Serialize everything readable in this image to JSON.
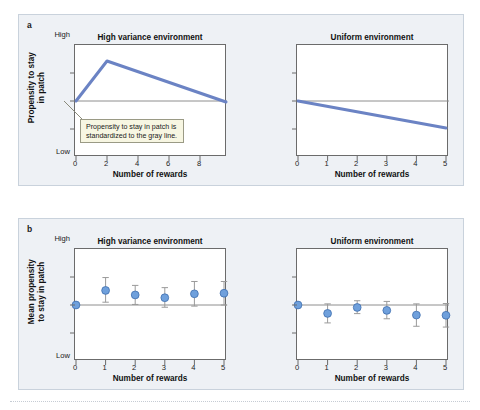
{
  "figure": {
    "panels": [
      {
        "letter": "a",
        "ylabel": "Propensity to stay\nin patch",
        "y_high_label": "High",
        "y_low_label": "Low",
        "plots": [
          {
            "title": "High variance environment",
            "xlabel": "Number of rewards",
            "xticks": [
              "0",
              "2",
              "4",
              "6",
              "8"
            ]
          },
          {
            "title": "Uniform environment",
            "xlabel": "Number of rewards",
            "xticks": [
              "0",
              "1",
              "2",
              "3",
              "4",
              "5"
            ]
          }
        ],
        "callout": "Propensity to stay in patch is\nstandardized to the gray line."
      },
      {
        "letter": "b",
        "ylabel": "Mean propensity\nto stay in patch",
        "y_high_label": "High",
        "y_low_label": "Low",
        "plots": [
          {
            "title": "High variance environment",
            "xlabel": "Number of rewards",
            "xticks": [
              "0",
              "1",
              "2",
              "3",
              "4",
              "5"
            ]
          },
          {
            "title": "Uniform environment",
            "xlabel": "Number of rewards",
            "xticks": [
              "0",
              "1",
              "2",
              "3",
              "4",
              "5"
            ]
          }
        ]
      }
    ]
  },
  "colors": {
    "line_blue": "#6b83c4",
    "marker_blue": "#6fa0dc",
    "marker_edge": "#3f6fae",
    "errorbar_gray": "#9a9a9a",
    "reference_gray": "#8e8e8e",
    "panel_bg": "#eef1f5",
    "axis_black": "#6b6b6b",
    "callout_bg": "#f7f6e2"
  },
  "chart_data": [
    {
      "type": "line",
      "panel": "a",
      "subplot": "left",
      "title": "High variance environment",
      "xlabel": "Number of rewards",
      "ylabel": "Propensity to stay in patch",
      "xlim": [
        0,
        9.6
      ],
      "ylim": [
        0,
        1
      ],
      "xticks": [
        0,
        2,
        4,
        6,
        8
      ],
      "ytick_labels": [
        "Low",
        "High"
      ],
      "grid": false,
      "reference_line_y": 0.5,
      "reference_line_label": "gray line (standardized propensity)",
      "x": [
        0,
        2,
        9.6
      ],
      "y": [
        0.5,
        0.86,
        0.49
      ],
      "annotation": "Propensity to stay in patch is standardized to the gray line."
    },
    {
      "type": "line",
      "panel": "a",
      "subplot": "right",
      "title": "Uniform environment",
      "xlabel": "Number of rewards",
      "ylabel": "Propensity to stay in patch",
      "xlim": [
        0,
        5
      ],
      "ylim": [
        0,
        1
      ],
      "xticks": [
        0,
        1,
        2,
        3,
        4,
        5
      ],
      "ytick_labels": [
        "Low",
        "High"
      ],
      "grid": false,
      "reference_line_y": 0.5,
      "x": [
        0,
        5
      ],
      "y": [
        0.5,
        0.26
      ]
    },
    {
      "type": "scatter",
      "panel": "b",
      "subplot": "left",
      "title": "High variance environment",
      "xlabel": "Number of rewards",
      "ylabel": "Mean propensity to stay in patch",
      "xlim": [
        0,
        5
      ],
      "ylim": [
        0,
        1
      ],
      "xticks": [
        0,
        1,
        2,
        3,
        4,
        5
      ],
      "ytick_labels": [
        "Low",
        "High"
      ],
      "grid": false,
      "reference_line_y": 0.5,
      "x": [
        0,
        1,
        2,
        3,
        4,
        5
      ],
      "y": [
        0.5,
        0.63,
        0.59,
        0.565,
        0.6,
        0.605
      ],
      "yerr_low": [
        0.0,
        0.105,
        0.085,
        0.085,
        0.11,
        0.105
      ],
      "yerr_high": [
        0.0,
        0.115,
        0.085,
        0.09,
        0.11,
        0.105
      ]
    },
    {
      "type": "scatter",
      "panel": "b",
      "subplot": "right",
      "title": "Uniform environment",
      "xlabel": "Number of rewards",
      "ylabel": "Mean propensity to stay in patch",
      "xlim": [
        0,
        5
      ],
      "ylim": [
        0,
        1
      ],
      "xticks": [
        0,
        1,
        2,
        3,
        4,
        5
      ],
      "ytick_labels": [
        "Low",
        "High"
      ],
      "grid": false,
      "reference_line_y": 0.5,
      "x": [
        0,
        1,
        2,
        3,
        4,
        5
      ],
      "y": [
        0.5,
        0.425,
        0.478,
        0.452,
        0.41,
        0.408
      ],
      "yerr_low": [
        0.0,
        0.085,
        0.055,
        0.075,
        0.1,
        0.105
      ],
      "yerr_high": [
        0.0,
        0.085,
        0.06,
        0.08,
        0.1,
        0.105
      ]
    }
  ]
}
